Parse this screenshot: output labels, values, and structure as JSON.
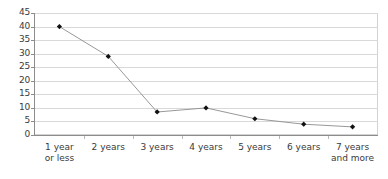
{
  "chart_data": {
    "type": "line",
    "title": "",
    "subtitle": "",
    "xlabel": "",
    "ylabel": "",
    "categories": [
      "1 year\nor less",
      "2 years",
      "3 years",
      "4 years",
      "5 years",
      "6 years",
      "7 years\nand more"
    ],
    "series": [
      {
        "name": "",
        "values": [
          40,
          29,
          8.5,
          10,
          6,
          4,
          3
        ]
      }
    ],
    "ylim": [
      0,
      45
    ],
    "ytick_step": 5,
    "yticks": [
      0,
      5,
      10,
      15,
      20,
      25,
      30,
      35,
      40,
      45
    ],
    "ytick_labels": [
      "0",
      "5",
      "10",
      "15",
      "20",
      "25",
      "30",
      "35",
      "40",
      "45"
    ],
    "grid": true,
    "grid_axis": "y",
    "legend": false,
    "legend_position": "none",
    "marker": "diamond",
    "line_color": "#8c8c8c",
    "marker_color": "#111111",
    "grid_color": "#d9d9d9",
    "axis_color": "#8c8c8c",
    "background_color": "#ffffff",
    "text_color": "#3a3a3a"
  }
}
